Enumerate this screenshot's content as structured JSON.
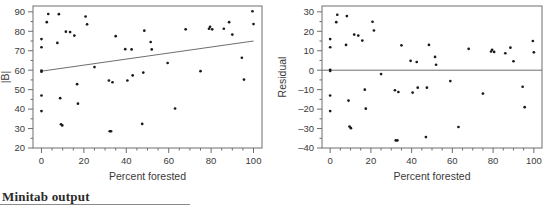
{
  "caption": "Minitab output",
  "chart_data": [
    {
      "id": "abs-resid-vs-forested",
      "type": "scatter",
      "title": "",
      "xlabel": "Percent forested",
      "ylabel": "|B|",
      "xlim": [
        -4,
        104
      ],
      "ylim": [
        20,
        93
      ],
      "xticks": [
        0,
        20,
        40,
        60,
        80,
        100
      ],
      "yticks": [
        20,
        30,
        40,
        50,
        60,
        70,
        80,
        90
      ],
      "xminor_step": 5,
      "yminor_step": 5,
      "grid": false,
      "legend": false,
      "trendline": {
        "x": [
          0,
          100
        ],
        "y": [
          59.5,
          75.0
        ]
      },
      "points": [
        [
          0.0,
          76.0
        ],
        [
          0.0,
          71.8
        ],
        [
          0.0,
          59.8
        ],
        [
          0.0,
          59.2
        ],
        [
          0.0,
          47.0
        ],
        [
          0.0,
          39.0
        ],
        [
          2.5,
          84.7
        ],
        [
          3.2,
          88.9
        ],
        [
          7.5,
          74.0
        ],
        [
          8.2,
          88.8
        ],
        [
          8.8,
          45.6
        ],
        [
          9.2,
          32.2
        ],
        [
          9.8,
          31.6
        ],
        [
          11.5,
          79.8
        ],
        [
          13.5,
          79.6
        ],
        [
          15.5,
          77.8
        ],
        [
          16.8,
          52.8
        ],
        [
          17.2,
          42.8
        ],
        [
          20.8,
          87.6
        ],
        [
          21.5,
          83.6
        ],
        [
          25.0,
          61.6
        ],
        [
          31.8,
          54.7
        ],
        [
          32.2,
          28.6
        ],
        [
          32.8,
          28.6
        ],
        [
          33.5,
          53.8
        ],
        [
          35.0,
          77.5
        ],
        [
          39.5,
          70.8
        ],
        [
          40.5,
          54.7
        ],
        [
          42.5,
          70.7
        ],
        [
          43.0,
          57.3
        ],
        [
          47.5,
          32.4
        ],
        [
          48.0,
          58.8
        ],
        [
          48.5,
          80.3
        ],
        [
          51.5,
          74.5
        ],
        [
          52.0,
          70.7
        ],
        [
          59.5,
          63.7
        ],
        [
          63.0,
          40.3
        ],
        [
          68.0,
          81.0
        ],
        [
          75.0,
          59.5
        ],
        [
          79.0,
          81.3
        ],
        [
          79.5,
          82.3
        ],
        [
          80.5,
          81.0
        ],
        [
          86.0,
          81.3
        ],
        [
          88.5,
          84.7
        ],
        [
          90.0,
          78.3
        ],
        [
          94.5,
          66.4
        ],
        [
          95.5,
          55.2
        ],
        [
          99.5,
          90.3
        ],
        [
          100.0,
          83.7
        ]
      ]
    },
    {
      "id": "residual-vs-forested",
      "type": "scatter",
      "title": "",
      "xlabel": "Percent forested",
      "ylabel": "Residual",
      "xlim": [
        -4,
        104
      ],
      "ylim": [
        -40,
        33
      ],
      "xticks": [
        0,
        20,
        40,
        60,
        80,
        100
      ],
      "yticks": [
        -40,
        -30,
        -20,
        -10,
        0,
        10,
        20,
        30
      ],
      "xminor_step": 5,
      "yminor_step": 5,
      "grid": false,
      "legend": false,
      "zeroline": {
        "x": [
          -4,
          104
        ],
        "y": 0
      },
      "points": [
        [
          0.0,
          16.0
        ],
        [
          0.0,
          11.8
        ],
        [
          0.0,
          0.2
        ],
        [
          0.0,
          -0.4
        ],
        [
          0.0,
          -13.0
        ],
        [
          0.0,
          -21.0
        ],
        [
          3.0,
          24.7
        ],
        [
          3.5,
          28.5
        ],
        [
          7.8,
          13.0
        ],
        [
          8.2,
          27.8
        ],
        [
          9.0,
          -15.6
        ],
        [
          9.5,
          -29.0
        ],
        [
          10.2,
          -29.8
        ],
        [
          11.8,
          18.3
        ],
        [
          13.8,
          17.8
        ],
        [
          15.8,
          15.2
        ],
        [
          17.0,
          -10.0
        ],
        [
          17.5,
          -19.8
        ],
        [
          20.8,
          24.9
        ],
        [
          21.5,
          20.4
        ],
        [
          25.0,
          -2.0
        ],
        [
          31.8,
          -10.3
        ],
        [
          32.2,
          -36.1
        ],
        [
          33.0,
          -36.1
        ],
        [
          33.5,
          -11.2
        ],
        [
          35.0,
          12.8
        ],
        [
          39.5,
          4.8
        ],
        [
          40.5,
          -11.5
        ],
        [
          42.5,
          4.2
        ],
        [
          43.0,
          -9.0
        ],
        [
          47.0,
          -34.4
        ],
        [
          47.5,
          -9.0
        ],
        [
          48.5,
          13.0
        ],
        [
          51.5,
          6.8
        ],
        [
          52.0,
          2.8
        ],
        [
          59.0,
          -5.6
        ],
        [
          63.0,
          -29.2
        ],
        [
          68.0,
          11.0
        ],
        [
          75.0,
          -12.0
        ],
        [
          79.0,
          9.6
        ],
        [
          79.5,
          10.5
        ],
        [
          80.5,
          9.4
        ],
        [
          86.0,
          8.7
        ],
        [
          88.5,
          11.6
        ],
        [
          90.0,
          4.6
        ],
        [
          94.5,
          -8.5
        ],
        [
          95.5,
          -19.0
        ],
        [
          99.5,
          15.0
        ],
        [
          100.0,
          9.2
        ]
      ]
    }
  ]
}
